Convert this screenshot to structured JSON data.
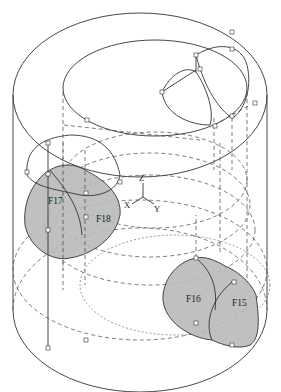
{
  "figure": {
    "type": "cad-wireframe",
    "colors": {
      "line": "#333333",
      "face_fill": "#b9b9b9",
      "background": "#ffffff"
    }
  },
  "labels": {
    "faces": [
      {
        "id": "F17",
        "text": "F17"
      },
      {
        "id": "F18",
        "text": "F18"
      },
      {
        "id": "F16",
        "text": "F16"
      },
      {
        "id": "F15",
        "text": "F15"
      }
    ],
    "axes": {
      "z": "Z",
      "x": "X",
      "y": "Y"
    }
  }
}
